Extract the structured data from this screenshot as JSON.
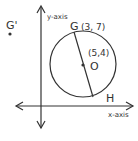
{
  "diagram": {
    "type": "coordinate-geometry",
    "axes": {
      "x_label": "x-axis",
      "y_label": "y-axis"
    },
    "circle": {
      "center_label": "O",
      "center_coords": "(5,4)"
    },
    "points": {
      "G": {
        "label": "G",
        "coords": "(3, 7)"
      },
      "H": {
        "label": "H"
      },
      "G_prime": {
        "label": "G'"
      }
    },
    "colors": {
      "stroke": "#333333",
      "background": "#ffffff"
    }
  }
}
